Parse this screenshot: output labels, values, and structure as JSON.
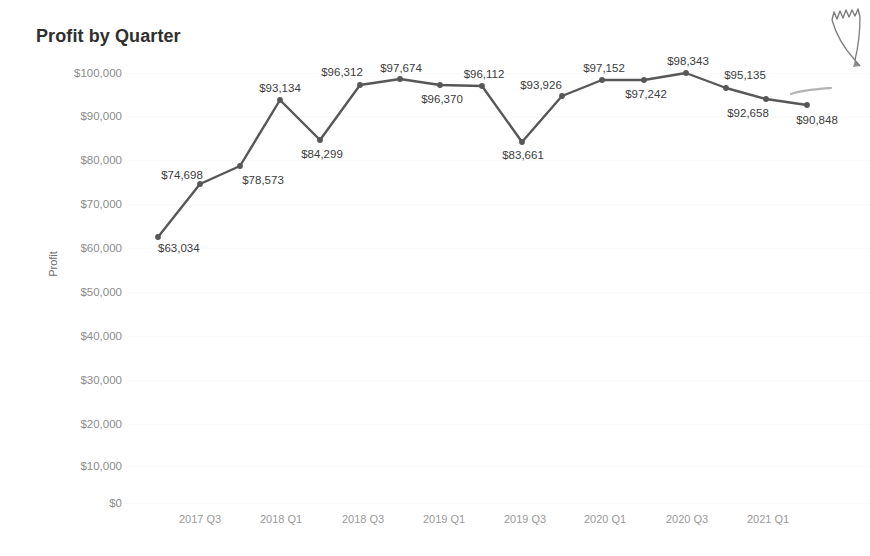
{
  "chart_data": {
    "type": "line",
    "title": "Profit by Quarter",
    "xlabel": "",
    "ylabel": "Profit",
    "ylim": [
      0,
      100000
    ],
    "grid": true,
    "legend": "none",
    "value_prefix": "$",
    "categories": [
      "2017 Q2",
      "2017 Q3",
      "2017 Q4",
      "2018 Q1",
      "2018 Q2",
      "2018 Q3",
      "2018 Q4",
      "2019 Q1",
      "2019 Q2",
      "2019 Q3",
      "2019 Q4",
      "2020 Q1",
      "2020 Q2",
      "2020 Q3",
      "2020 Q4",
      "2021 Q1"
    ],
    "values": [
      63034,
      74698,
      78573,
      93134,
      84299,
      96312,
      97674,
      96370,
      96112,
      83661,
      93926,
      97152,
      97242,
      98343,
      95135,
      92658
    ],
    "point_labels": [
      "$63,034",
      "$74,698",
      "$78,573",
      "$93,134",
      "$84,299",
      "$96,312",
      "$97,674",
      "$96,370",
      "$96,112",
      "$83,661",
      "$93,926",
      "$97,152",
      "$97,242",
      "$98,343",
      "$95,135",
      "$92,658",
      "$90,848"
    ],
    "y_ticks": [
      "$0",
      "$10,000",
      "$20,000",
      "$30,000",
      "$40,000",
      "$50,000",
      "$60,000",
      "$70,000",
      "$80,000",
      "$90,000",
      "$100,000"
    ],
    "y_tick_values": [
      0,
      10000,
      20000,
      30000,
      40000,
      50000,
      60000,
      70000,
      80000,
      90000,
      100000
    ],
    "x_ticks": [
      "2017 Q3",
      "2018 Q1",
      "2018 Q3",
      "2019 Q1",
      "2019 Q3",
      "2020 Q1",
      "2020 Q3",
      "2021 Q1"
    ],
    "series_color": "#575757",
    "label_color": "#3b3b3b",
    "axis_text_color": "#8c8c8c",
    "title_color": "#2f2f2f"
  },
  "points": [
    {
      "label": "$63,034",
      "value": 63034,
      "x": 158,
      "y": 237,
      "lx": 158,
      "ly": 248,
      "anchor": "left"
    },
    {
      "label": "$74,698",
      "value": 74698,
      "x": 200,
      "y": 184,
      "lx": 182,
      "ly": 175,
      "anchor": "center"
    },
    {
      "label": "$78,573",
      "value": 78573,
      "x": 240,
      "y": 166,
      "lx": 263,
      "ly": 180,
      "anchor": "center"
    },
    {
      "label": "$93,134",
      "value": 93134,
      "x": 280,
      "y": 100,
      "lx": 280,
      "ly": 88,
      "anchor": "center"
    },
    {
      "label": "$84,299",
      "value": 84299,
      "x": 320,
      "y": 140,
      "lx": 322,
      "ly": 154,
      "anchor": "center"
    },
    {
      "label": "$96,312",
      "value": 96312,
      "x": 360,
      "y": 85,
      "lx": 342,
      "ly": 72,
      "anchor": "center"
    },
    {
      "label": "$97,674",
      "value": 97674,
      "x": 400,
      "y": 79,
      "lx": 401,
      "ly": 68,
      "anchor": "center"
    },
    {
      "label": "$96,370",
      "value": 96370,
      "x": 440,
      "y": 85,
      "lx": 442,
      "ly": 99,
      "anchor": "center"
    },
    {
      "label": "$96,112",
      "value": 96112,
      "x": 482,
      "y": 86,
      "lx": 484,
      "ly": 74,
      "anchor": "center"
    },
    {
      "label": "$83,661",
      "value": 83661,
      "x": 522,
      "y": 142,
      "lx": 523,
      "ly": 155,
      "anchor": "center"
    },
    {
      "label": "$93,926",
      "value": 93926,
      "x": 562,
      "y": 96,
      "lx": 541,
      "ly": 85,
      "anchor": "center"
    },
    {
      "label": "$97,152",
      "value": 97152,
      "x": 602,
      "y": 80,
      "lx": 604,
      "ly": 68,
      "anchor": "center"
    },
    {
      "label": "$97,242",
      "value": 97242,
      "x": 644,
      "y": 80,
      "lx": 646,
      "ly": 94,
      "anchor": "center"
    },
    {
      "label": "$98,343",
      "value": 98343,
      "x": 686,
      "y": 73,
      "lx": 688,
      "ly": 61,
      "anchor": "center"
    },
    {
      "label": "$95,135",
      "value": 95135,
      "x": 726,
      "y": 88,
      "lx": 745,
      "ly": 75,
      "anchor": "center"
    },
    {
      "label": "$92,658",
      "value": 92658,
      "x": 766,
      "y": 99,
      "lx": 748,
      "ly": 113,
      "anchor": "center"
    },
    {
      "label": "$90,848",
      "value": 90848,
      "x": 807,
      "y": 105,
      "lx": 817,
      "ly": 120,
      "anchor": "center"
    }
  ],
  "y_axis": [
    {
      "label": "$100,000",
      "y": 73
    },
    {
      "label": "$90,000",
      "y": 116
    },
    {
      "label": "$80,000",
      "y": 160
    },
    {
      "label": "$70,000",
      "y": 204
    },
    {
      "label": "$60,000",
      "y": 248
    },
    {
      "label": "$50,000",
      "y": 292
    },
    {
      "label": "$40,000",
      "y": 336
    },
    {
      "label": "$30,000",
      "y": 380
    },
    {
      "label": "$20,000",
      "y": 424
    },
    {
      "label": "$10,000",
      "y": 466
    },
    {
      "label": "$0",
      "y": 503
    }
  ],
  "x_axis": [
    {
      "label": "2017 Q3",
      "x": 200
    },
    {
      "label": "2018 Q1",
      "x": 281
    },
    {
      "label": "2018 Q3",
      "x": 363
    },
    {
      "label": "2019 Q1",
      "x": 444
    },
    {
      "label": "2019 Q3",
      "x": 525
    },
    {
      "label": "2020 Q1",
      "x": 605
    },
    {
      "label": "2020 Q3",
      "x": 687
    },
    {
      "label": "2021 Q1",
      "x": 768
    }
  ],
  "header": {
    "title": "Profit by Quarter"
  },
  "axis_titles": {
    "y": "Profit"
  }
}
